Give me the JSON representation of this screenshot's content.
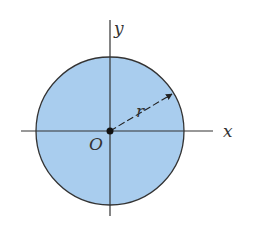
{
  "diagram": {
    "type": "circle-on-axes",
    "labels": {
      "x_axis": "x",
      "y_axis": "y",
      "origin": "O",
      "radius": "r"
    },
    "colors": {
      "fill": "#a9cdee",
      "stroke": "#333333",
      "background": "#ffffff"
    }
  }
}
